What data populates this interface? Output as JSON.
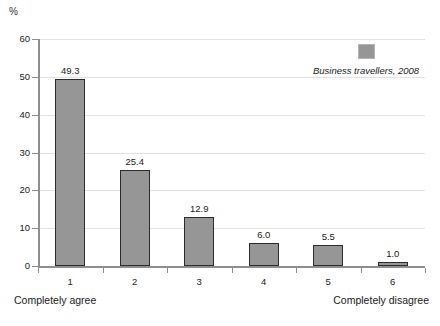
{
  "chart_data": {
    "type": "bar",
    "title": "",
    "subtitle": "",
    "xlabel": "",
    "ylabel": "%",
    "categories": [
      "1",
      "2",
      "3",
      "4",
      "5",
      "6"
    ],
    "values": [
      49.3,
      25.4,
      12.9,
      6.0,
      5.5,
      1.0
    ],
    "value_labels": [
      "49.3",
      "25.4",
      "12.9",
      "6.0",
      "5.5",
      "1.0"
    ],
    "series": [
      {
        "name": "Business travellers, 2008",
        "values": [
          49.3,
          25.4,
          12.9,
          6.0,
          5.5,
          1.0
        ],
        "color": "#969696"
      }
    ],
    "ylim": [
      0,
      60
    ],
    "yticks": [
      0,
      10,
      20,
      30,
      40,
      50,
      60
    ],
    "ytick_labels": [
      "0",
      "10",
      "20",
      "30",
      "40",
      "50",
      "60"
    ],
    "grid": true,
    "grid_axis": "y",
    "legend_position": "top-right",
    "scale_anchor_low": "Completely agree",
    "scale_anchor_high": "Completely disagree",
    "bar_color": "#969696",
    "bar_edge_color": "#2b2b2b",
    "gridline_color": "#e2e2e2",
    "axis_color": "#8e8e8e"
  },
  "axis": {
    "unit_label": "%"
  },
  "legend": {
    "entries": [
      {
        "label": "Business travellers, 2008",
        "color": "#969696"
      }
    ]
  },
  "anchors": {
    "left": "Completely agree",
    "right": "Completely disagree"
  }
}
